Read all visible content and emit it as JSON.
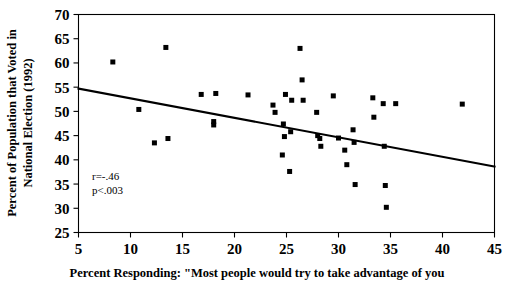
{
  "chart_data": {
    "type": "scatter",
    "title": "",
    "xlabel": "Percent Responding: \"Most people would try to take advantage of you",
    "ylabel": "Percent of Population that Voted in National Election (1992)",
    "xlim": [
      5,
      45
    ],
    "ylim": [
      25,
      70
    ],
    "xticks": [
      5,
      10,
      15,
      20,
      25,
      30,
      35,
      40,
      45
    ],
    "yticks": [
      25,
      30,
      35,
      40,
      45,
      50,
      55,
      60,
      65,
      70
    ],
    "xtick_labels": [
      "5",
      "10",
      "15",
      "20",
      "25",
      "30",
      "35",
      "40",
      "45"
    ],
    "ytick_labels": [
      "25",
      "30",
      "35",
      "40",
      "45",
      "50",
      "55",
      "60",
      "65",
      "70"
    ],
    "grid": false,
    "legend": false,
    "marker": "square",
    "marker_color": "#000000",
    "points": [
      {
        "x": 8.3,
        "y": 60.2
      },
      {
        "x": 10.8,
        "y": 50.4
      },
      {
        "x": 12.3,
        "y": 43.5
      },
      {
        "x": 13.4,
        "y": 63.2
      },
      {
        "x": 13.6,
        "y": 44.4
      },
      {
        "x": 16.8,
        "y": 53.5
      },
      {
        "x": 18.0,
        "y": 47.9
      },
      {
        "x": 18.0,
        "y": 47.2
      },
      {
        "x": 18.2,
        "y": 53.7
      },
      {
        "x": 21.3,
        "y": 53.4
      },
      {
        "x": 23.7,
        "y": 51.3
      },
      {
        "x": 23.9,
        "y": 49.8
      },
      {
        "x": 24.7,
        "y": 47.4
      },
      {
        "x": 24.8,
        "y": 44.8
      },
      {
        "x": 24.6,
        "y": 41.0
      },
      {
        "x": 24.9,
        "y": 53.5
      },
      {
        "x": 25.5,
        "y": 52.3
      },
      {
        "x": 25.4,
        "y": 45.8
      },
      {
        "x": 25.3,
        "y": 37.6
      },
      {
        "x": 26.3,
        "y": 63.0
      },
      {
        "x": 26.5,
        "y": 56.5
      },
      {
        "x": 26.6,
        "y": 52.3
      },
      {
        "x": 27.9,
        "y": 49.8
      },
      {
        "x": 28.0,
        "y": 45.0
      },
      {
        "x": 28.2,
        "y": 44.4
      },
      {
        "x": 28.3,
        "y": 42.8
      },
      {
        "x": 29.5,
        "y": 53.2
      },
      {
        "x": 30.0,
        "y": 44.5
      },
      {
        "x": 30.6,
        "y": 42.0
      },
      {
        "x": 30.8,
        "y": 39.0
      },
      {
        "x": 31.4,
        "y": 46.2
      },
      {
        "x": 31.5,
        "y": 43.6
      },
      {
        "x": 31.6,
        "y": 34.9
      },
      {
        "x": 33.3,
        "y": 52.8
      },
      {
        "x": 33.4,
        "y": 48.8
      },
      {
        "x": 34.3,
        "y": 51.6
      },
      {
        "x": 34.4,
        "y": 42.8
      },
      {
        "x": 34.5,
        "y": 34.7
      },
      {
        "x": 34.6,
        "y": 30.2
      },
      {
        "x": 35.5,
        "y": 51.6
      },
      {
        "x": 41.9,
        "y": 51.5
      }
    ],
    "trend_line": {
      "x_start": 5,
      "y_start": 54.7,
      "x_end": 45,
      "y_end": 38.6
    },
    "annotations": {
      "correlation": "r=-.46",
      "pvalue": "p<.003"
    }
  }
}
